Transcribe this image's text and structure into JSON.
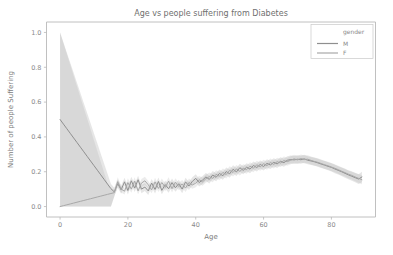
{
  "figure": {
    "background": "#ffffff",
    "width": 393,
    "height": 255
  },
  "chart_data": {
    "type": "line",
    "title": "Age vs people suffering from Diabetes",
    "xlabel": "Age",
    "ylabel": "Number of people Suffering",
    "xlim": [
      -4,
      93
    ],
    "ylim": [
      -0.06,
      1.06
    ],
    "xticks": [
      0,
      20,
      40,
      60,
      80
    ],
    "xtick_labels": [
      "0",
      "20",
      "40",
      "60",
      "80"
    ],
    "yticks": [
      0.0,
      0.2,
      0.4,
      0.6,
      0.8,
      1.0
    ],
    "ytick_labels": [
      "0.0",
      "0.2",
      "0.4",
      "0.6",
      "0.8",
      "1.0"
    ],
    "grid": false,
    "legend": {
      "title": "gender",
      "position": "upper right",
      "entries": [
        {
          "label": "M",
          "color": "#8f8f8f"
        },
        {
          "label": "F",
          "color": "#a8a8a8"
        }
      ]
    },
    "band_opacity": 0.22,
    "series": [
      {
        "name": "M",
        "color": "#8f8f8f",
        "x": [
          0,
          1,
          2,
          3,
          4,
          5,
          6,
          7,
          8,
          9,
          10,
          11,
          12,
          13,
          14,
          15,
          16,
          17,
          18,
          19,
          20,
          21,
          22,
          23,
          24,
          25,
          26,
          27,
          28,
          29,
          30,
          31,
          32,
          33,
          34,
          35,
          36,
          37,
          38,
          39,
          40,
          41,
          42,
          43,
          44,
          45,
          46,
          47,
          48,
          49,
          50,
          51,
          52,
          53,
          54,
          55,
          56,
          57,
          58,
          59,
          60,
          61,
          62,
          63,
          64,
          65,
          66,
          67,
          68,
          69,
          70,
          71,
          72,
          73,
          74,
          75,
          76,
          77,
          78,
          79,
          80,
          81,
          82,
          83,
          84,
          85,
          86,
          87,
          88,
          89
        ],
        "values": [
          0.5,
          0.4735,
          0.447,
          0.4205,
          0.394,
          0.3676,
          0.3411,
          0.3146,
          0.2881,
          0.2616,
          0.2351,
          0.2086,
          0.1821,
          0.1556,
          0.1291,
          0.1026,
          0.084,
          0.132,
          0.096,
          0.142,
          0.092,
          0.148,
          0.106,
          0.154,
          0.1,
          0.112,
          0.09,
          0.135,
          0.098,
          0.144,
          0.093,
          0.126,
          0.102,
          0.138,
          0.108,
          0.131,
          0.1,
          0.142,
          0.118,
          0.145,
          0.162,
          0.138,
          0.152,
          0.17,
          0.156,
          0.181,
          0.168,
          0.19,
          0.177,
          0.201,
          0.188,
          0.214,
          0.199,
          0.223,
          0.208,
          0.226,
          0.215,
          0.236,
          0.224,
          0.242,
          0.23,
          0.248,
          0.239,
          0.254,
          0.245,
          0.26,
          0.252,
          0.266,
          0.27,
          0.268,
          0.272,
          0.269,
          0.274,
          0.266,
          0.262,
          0.257,
          0.251,
          0.244,
          0.238,
          0.231,
          0.225,
          0.216,
          0.208,
          0.2,
          0.191,
          0.182,
          0.174,
          0.166,
          0.158,
          0.17
        ],
        "lower": [
          0.0,
          0.0,
          0.0,
          0.0,
          0.0,
          0.0,
          0.0,
          0.0,
          0.0,
          0.0,
          0.0,
          0.0,
          0.0,
          0.0,
          0.0,
          0.0,
          0.06,
          0.108,
          0.073,
          0.119,
          0.069,
          0.125,
          0.083,
          0.131,
          0.077,
          0.089,
          0.067,
          0.112,
          0.075,
          0.121,
          0.07,
          0.103,
          0.079,
          0.115,
          0.085,
          0.108,
          0.077,
          0.119,
          0.095,
          0.122,
          0.139,
          0.115,
          0.129,
          0.147,
          0.133,
          0.158,
          0.145,
          0.167,
          0.154,
          0.178,
          0.165,
          0.191,
          0.176,
          0.2,
          0.185,
          0.203,
          0.192,
          0.213,
          0.201,
          0.219,
          0.207,
          0.225,
          0.216,
          0.231,
          0.222,
          0.237,
          0.229,
          0.243,
          0.247,
          0.245,
          0.249,
          0.246,
          0.251,
          0.243,
          0.239,
          0.234,
          0.228,
          0.221,
          0.215,
          0.208,
          0.201,
          0.192,
          0.184,
          0.176,
          0.166,
          0.157,
          0.148,
          0.139,
          0.13,
          0.14
        ],
        "upper": [
          1.0,
          0.942,
          0.884,
          0.826,
          0.768,
          0.71,
          0.652,
          0.594,
          0.536,
          0.478,
          0.42,
          0.362,
          0.304,
          0.246,
          0.188,
          0.13,
          0.108,
          0.156,
          0.119,
          0.165,
          0.115,
          0.171,
          0.129,
          0.177,
          0.123,
          0.135,
          0.113,
          0.158,
          0.121,
          0.167,
          0.116,
          0.149,
          0.125,
          0.161,
          0.131,
          0.154,
          0.123,
          0.165,
          0.141,
          0.168,
          0.185,
          0.161,
          0.175,
          0.193,
          0.179,
          0.204,
          0.191,
          0.213,
          0.2,
          0.224,
          0.211,
          0.237,
          0.222,
          0.246,
          0.231,
          0.249,
          0.238,
          0.259,
          0.247,
          0.265,
          0.253,
          0.271,
          0.262,
          0.277,
          0.268,
          0.283,
          0.275,
          0.289,
          0.293,
          0.291,
          0.295,
          0.292,
          0.297,
          0.289,
          0.285,
          0.28,
          0.274,
          0.267,
          0.261,
          0.254,
          0.249,
          0.24,
          0.232,
          0.224,
          0.216,
          0.207,
          0.2,
          0.193,
          0.186,
          0.2
        ]
      },
      {
        "name": "F",
        "color": "#a8a8a8",
        "x": [
          0,
          1,
          2,
          3,
          4,
          5,
          6,
          7,
          8,
          9,
          10,
          11,
          12,
          13,
          14,
          15,
          16,
          17,
          18,
          19,
          20,
          21,
          22,
          23,
          24,
          25,
          26,
          27,
          28,
          29,
          30,
          31,
          32,
          33,
          34,
          35,
          36,
          37,
          38,
          39,
          40,
          41,
          42,
          43,
          44,
          45,
          46,
          47,
          48,
          49,
          50,
          51,
          52,
          53,
          54,
          55,
          56,
          57,
          58,
          59,
          60,
          61,
          62,
          63,
          64,
          65,
          66,
          67,
          68,
          69,
          70,
          71,
          72,
          73,
          74,
          75,
          76,
          77,
          78,
          79,
          80,
          81,
          82,
          83,
          84,
          85,
          86,
          87,
          88,
          89
        ],
        "values": [
          0.0,
          0.005,
          0.01,
          0.015,
          0.02,
          0.025,
          0.03,
          0.035,
          0.04,
          0.045,
          0.05,
          0.055,
          0.06,
          0.065,
          0.07,
          0.075,
          0.08,
          0.143,
          0.101,
          0.088,
          0.138,
          0.1,
          0.146,
          0.09,
          0.135,
          0.148,
          0.125,
          0.096,
          0.142,
          0.104,
          0.138,
          0.11,
          0.146,
          0.102,
          0.14,
          0.115,
          0.13,
          0.106,
          0.138,
          0.124,
          0.134,
          0.154,
          0.142,
          0.16,
          0.172,
          0.162,
          0.185,
          0.174,
          0.196,
          0.184,
          0.208,
          0.196,
          0.216,
          0.202,
          0.22,
          0.212,
          0.232,
          0.22,
          0.24,
          0.228,
          0.246,
          0.235,
          0.253,
          0.242,
          0.258,
          0.25,
          0.264,
          0.258,
          0.266,
          0.274,
          0.268,
          0.276,
          0.27,
          0.272,
          0.265,
          0.259,
          0.254,
          0.247,
          0.24,
          0.234,
          0.227,
          0.22,
          0.212,
          0.203,
          0.195,
          0.186,
          0.179,
          0.17,
          0.162,
          0.154
        ],
        "lower": [
          0.0,
          0.0,
          0.0,
          0.0,
          0.0,
          0.0,
          0.0,
          0.0,
          0.0,
          0.0,
          0.0,
          0.0,
          0.0,
          0.0,
          0.0,
          0.0,
          0.058,
          0.118,
          0.081,
          0.069,
          0.114,
          0.079,
          0.123,
          0.07,
          0.112,
          0.125,
          0.103,
          0.076,
          0.119,
          0.083,
          0.115,
          0.088,
          0.123,
          0.081,
          0.118,
          0.093,
          0.108,
          0.084,
          0.115,
          0.102,
          0.111,
          0.131,
          0.119,
          0.137,
          0.149,
          0.139,
          0.162,
          0.151,
          0.173,
          0.161,
          0.185,
          0.173,
          0.193,
          0.179,
          0.197,
          0.189,
          0.209,
          0.197,
          0.217,
          0.205,
          0.223,
          0.212,
          0.23,
          0.219,
          0.235,
          0.227,
          0.241,
          0.235,
          0.243,
          0.251,
          0.245,
          0.253,
          0.247,
          0.249,
          0.242,
          0.236,
          0.231,
          0.224,
          0.217,
          0.211,
          0.204,
          0.197,
          0.189,
          0.18,
          0.172,
          0.163,
          0.155,
          0.146,
          0.137,
          0.128
        ],
        "upper": [
          1.0,
          0.938,
          0.876,
          0.814,
          0.752,
          0.69,
          0.628,
          0.566,
          0.504,
          0.442,
          0.38,
          0.318,
          0.256,
          0.194,
          0.132,
          0.1,
          0.102,
          0.168,
          0.121,
          0.107,
          0.162,
          0.121,
          0.169,
          0.11,
          0.158,
          0.171,
          0.147,
          0.116,
          0.165,
          0.125,
          0.161,
          0.132,
          0.169,
          0.123,
          0.162,
          0.137,
          0.152,
          0.128,
          0.161,
          0.146,
          0.157,
          0.177,
          0.165,
          0.183,
          0.195,
          0.185,
          0.208,
          0.197,
          0.219,
          0.207,
          0.231,
          0.219,
          0.239,
          0.225,
          0.243,
          0.235,
          0.255,
          0.243,
          0.263,
          0.251,
          0.269,
          0.258,
          0.276,
          0.265,
          0.281,
          0.273,
          0.287,
          0.281,
          0.289,
          0.297,
          0.291,
          0.299,
          0.293,
          0.295,
          0.288,
          0.282,
          0.277,
          0.27,
          0.263,
          0.257,
          0.25,
          0.243,
          0.235,
          0.226,
          0.218,
          0.209,
          0.203,
          0.194,
          0.187,
          0.18
        ]
      }
    ]
  }
}
